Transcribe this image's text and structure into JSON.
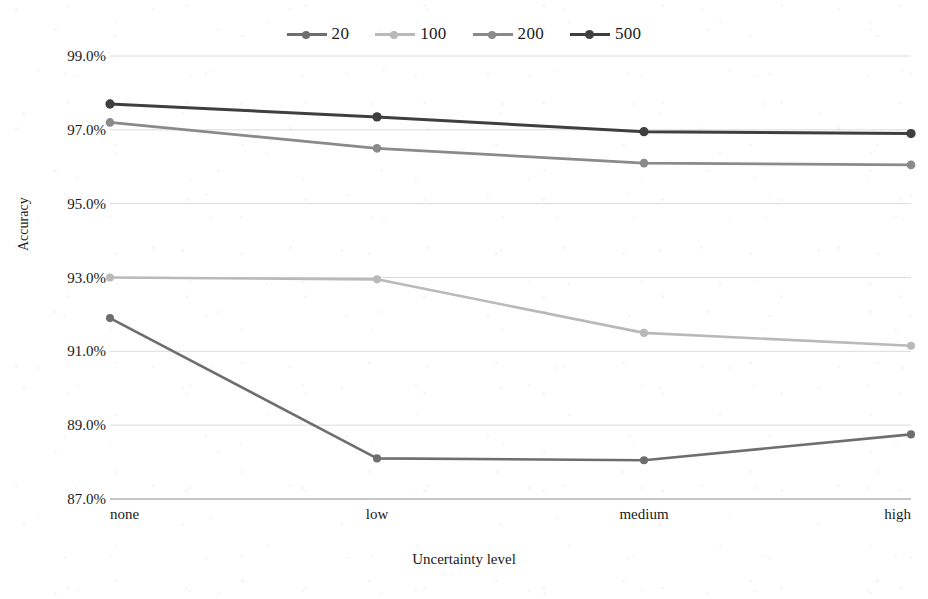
{
  "chart_data": {
    "type": "line",
    "title": "",
    "xlabel": "Uncertainty level",
    "ylabel": "Accuracy",
    "categories": [
      "none",
      "low",
      "medium",
      "high"
    ],
    "ylim": [
      87.0,
      99.0
    ],
    "ytick_step": 2.0,
    "ytick_labels": [
      "99.0%",
      "97.0%",
      "95.0%",
      "93.0%",
      "91.0%",
      "89.0%",
      "87.0%"
    ],
    "ytick_values": [
      99.0,
      97.0,
      95.0,
      93.0,
      91.0,
      89.0,
      87.0
    ],
    "yunit": "%",
    "grid": true,
    "grid_axis": "y",
    "legend_position": "top-center",
    "marker": "circle",
    "series": [
      {
        "name": "20",
        "color": "#6e6e6e",
        "line_width": 2.6,
        "values": [
          91.9,
          88.1,
          88.05,
          88.75
        ]
      },
      {
        "name": "100",
        "color": "#b9b9b9",
        "line_width": 2.6,
        "values": [
          93.0,
          92.95,
          91.5,
          91.15
        ]
      },
      {
        "name": "200",
        "color": "#8a8a8a",
        "line_width": 2.8,
        "values": [
          97.2,
          96.5,
          96.1,
          96.05
        ]
      },
      {
        "name": "500",
        "color": "#3f3f3f",
        "line_width": 3.0,
        "values": [
          97.7,
          97.35,
          96.95,
          96.9
        ]
      }
    ]
  },
  "colors": {
    "axis": "#8d8d8d",
    "grid": "#d8d8d8",
    "text": "#1a1a1a",
    "background": "#ffffff"
  }
}
